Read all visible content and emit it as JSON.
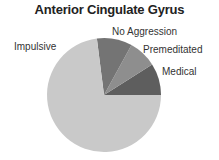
{
  "chart_data": {
    "type": "pie",
    "title": "Anterior Cingulate Gyrus",
    "slices": [
      {
        "label": "Medical",
        "value": 9,
        "color": "#5e5e5e"
      },
      {
        "label": "Premeditated",
        "value": 8,
        "color": "#8e8e8e"
      },
      {
        "label": "No Aggression",
        "value": 10,
        "color": "#747474"
      },
      {
        "label": "Impulsive",
        "value": 73,
        "color": "#c9c9c9"
      }
    ],
    "start_angle_deg": 0,
    "direction": "counterclockwise",
    "legend": "none (direct labels)"
  }
}
